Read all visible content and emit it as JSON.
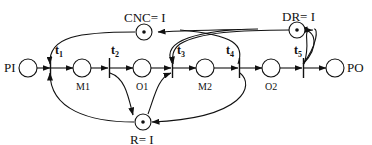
{
  "diagram": {
    "type": "petri-net",
    "places": {
      "PI": {
        "label": "PI",
        "tokens": 0
      },
      "M1": {
        "label": "M1",
        "tokens": 0
      },
      "O1": {
        "label": "O1",
        "tokens": 0
      },
      "M2": {
        "label": "M2",
        "tokens": 0
      },
      "O2": {
        "label": "O2",
        "tokens": 0
      },
      "PO": {
        "label": "PO",
        "tokens": 0
      },
      "CNC": {
        "label": "CNC= I",
        "tokens": 1
      },
      "DR": {
        "label": "DR= I",
        "tokens": 1
      },
      "R": {
        "label": "R= I",
        "tokens": 1
      }
    },
    "transitions": {
      "t1": {
        "base": "t",
        "sub": "1"
      },
      "t2": {
        "base": "t",
        "sub": "2"
      },
      "t3": {
        "base": "t",
        "sub": "3"
      },
      "t4": {
        "base": "t",
        "sub": "4"
      },
      "t5": {
        "base": "t",
        "sub": "5"
      }
    },
    "arcs": [
      [
        "PI",
        "t1"
      ],
      [
        "t1",
        "M1"
      ],
      [
        "M1",
        "t2"
      ],
      [
        "t2",
        "O1"
      ],
      [
        "O1",
        "t3"
      ],
      [
        "t3",
        "M2"
      ],
      [
        "M2",
        "t4"
      ],
      [
        "t4",
        "O2"
      ],
      [
        "O2",
        "t5"
      ],
      [
        "t5",
        "PO"
      ],
      [
        "CNC",
        "t1"
      ],
      [
        "R",
        "t1"
      ],
      [
        "t2",
        "R"
      ],
      [
        "t3",
        "CNC"
      ],
      [
        "R",
        "t3"
      ],
      [
        "DR",
        "t3"
      ],
      [
        "t4",
        "R"
      ],
      [
        "t5",
        "DR"
      ]
    ],
    "colors": {
      "stroke": "#111111",
      "background": "#ffffff"
    }
  }
}
